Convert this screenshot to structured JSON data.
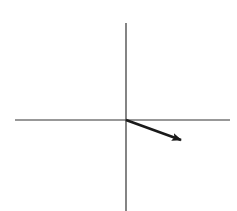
{
  "diagram": {
    "type": "vector-on-axes",
    "background": "#ffffff",
    "stroke_color": "#1a1a1a",
    "axes": {
      "origin": {
        "x": 126,
        "y": 120
      },
      "horizontal": {
        "x1": 15,
        "y1": 120,
        "x2": 230,
        "y2": 120
      },
      "vertical": {
        "x1": 126,
        "y1": 23,
        "x2": 126,
        "y2": 211
      }
    },
    "vector": {
      "from": {
        "x": 126,
        "y": 120
      },
      "to": {
        "x": 181,
        "y": 140
      },
      "direction": "down-right"
    }
  }
}
